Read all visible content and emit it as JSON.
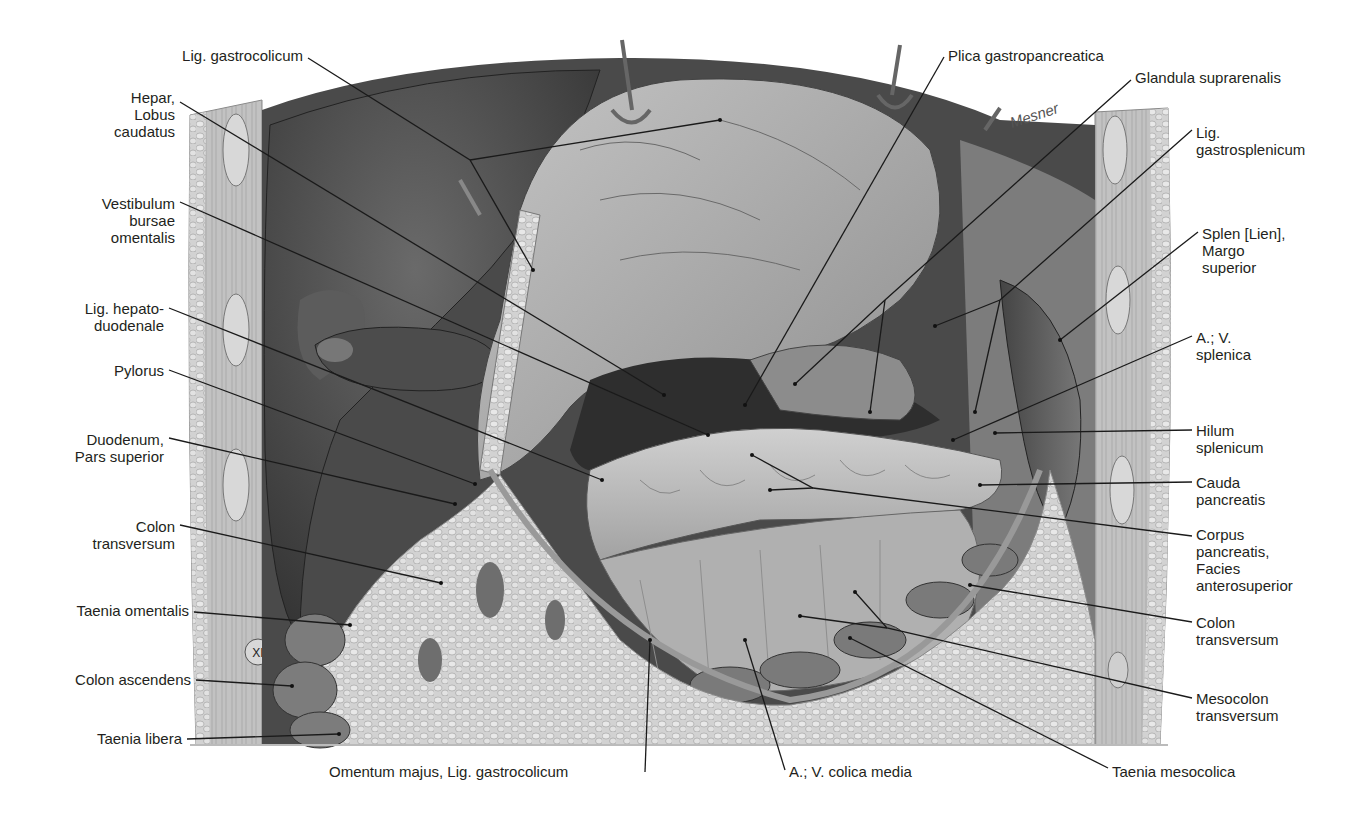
{
  "figure": {
    "type": "anatomical-illustration",
    "signature": "Mesner",
    "rib_marker": "XI"
  },
  "labels_left": [
    {
      "id": "lig-gastrocolicum-top",
      "text": "Lig. gastrocolicum",
      "x": 303,
      "y": 54,
      "ax": 533,
      "ay": 270
    },
    {
      "id": "hepar-lobus-caudatus",
      "text": "Hepar,\nLobus\ncaudatus",
      "x": 176,
      "y": 96,
      "ax": 664,
      "ay": 395
    },
    {
      "id": "vestibulum-bursae-omentalis",
      "text": "Vestibulum\nbursae\nomentalis",
      "x": 176,
      "y": 196,
      "ax": 708,
      "ay": 435
    },
    {
      "id": "lig-hepatoduodenale",
      "text": "Lig. hepato-\nduodenale",
      "x": 165,
      "y": 302,
      "ax": 602,
      "ay": 480
    },
    {
      "id": "pylorus",
      "text": "Pylorus",
      "x": 165,
      "y": 365,
      "ax": 475,
      "ay": 484
    },
    {
      "id": "duodenum-pars-superior",
      "text": "Duodenum,\nPars superior",
      "x": 165,
      "y": 432,
      "ax": 455,
      "ay": 504
    },
    {
      "id": "colon-transversum-left",
      "text": "Colon\ntransversum",
      "x": 176,
      "y": 519,
      "ax": 441,
      "ay": 583
    },
    {
      "id": "taenia-omentalis",
      "text": "Taenia omentalis",
      "x": 190,
      "y": 609,
      "ax": 350,
      "ay": 625
    },
    {
      "id": "colon-ascendens",
      "text": "Colon ascendens",
      "x": 192,
      "y": 678,
      "ax": 292,
      "ay": 686
    },
    {
      "id": "taenia-libera",
      "text": "Taenia libera",
      "x": 183,
      "y": 737,
      "ax": 339,
      "ay": 734
    }
  ],
  "labels_right": [
    {
      "id": "plica-gastropancreatica",
      "text": "Plica gastropancreatica",
      "x": 948,
      "y": 54,
      "ax": 745,
      "ay": 405
    },
    {
      "id": "glandula-suprarenalis",
      "text": "Glandula suprarenalis",
      "x": 1135,
      "y": 76,
      "ax": 795,
      "ay": 384
    },
    {
      "id": "lig-gastrosplenicum",
      "text": "Lig.\ngastrosplenicum",
      "x": 1196,
      "y": 125,
      "ax": 935,
      "ay": 326
    },
    {
      "id": "splen-margo-superior",
      "text": "Splen [Lien],\nMargo\nsuperior",
      "x": 1202,
      "y": 226,
      "ax": 1060,
      "ay": 340
    },
    {
      "id": "a-v-splenica",
      "text": "A.; V.\nsplenica",
      "x": 1196,
      "y": 330,
      "ax": 953,
      "ay": 440
    },
    {
      "id": "hilum-splenicum",
      "text": "Hilum\nsplenicum",
      "x": 1196,
      "y": 422,
      "ax": 995,
      "ay": 433
    },
    {
      "id": "cauda-pancreatis",
      "text": "Cauda\npancreatis",
      "x": 1196,
      "y": 474,
      "ax": 980,
      "ay": 485
    },
    {
      "id": "corpus-pancreatis",
      "text": "Corpus\npancreatis,\nFacies\nanterosuperior",
      "x": 1196,
      "y": 526,
      "ax": 770,
      "ay": 490
    },
    {
      "id": "colon-transversum-right",
      "text": "Colon\ntransversum",
      "x": 1196,
      "y": 614,
      "ax": 970,
      "ay": 585
    },
    {
      "id": "mesocolon-transversum",
      "text": "Mesocolon\ntransversum",
      "x": 1196,
      "y": 690,
      "ax": 800,
      "ay": 616
    },
    {
      "id": "taenia-mesocolica",
      "text": "Taenia mesocolica",
      "x": 1112,
      "y": 765,
      "ax": 850,
      "ay": 638
    }
  ],
  "labels_bottom": [
    {
      "id": "omentum-majus",
      "text": "Omentum majus, Lig. gastrocolicum",
      "x": 329,
      "y": 765,
      "ax": 650,
      "ay": 640
    },
    {
      "id": "a-v-colica-media",
      "text": "A.; V. colica media",
      "x": 789,
      "y": 765,
      "ax": 745,
      "ay": 640
    }
  ],
  "colors": {
    "text": "#231f20",
    "leader": "#1a1a1a",
    "liver_dark": "#3e3e3e",
    "liver_mid": "#5a5a5a",
    "wall": "#b8b8b8",
    "wall_light": "#d6d6d6",
    "stomach": "#a8a8a8",
    "stomach_light": "#c9c9c9",
    "pancreas": "#bdbdbd",
    "omentum": "#d0d0d0",
    "cavity": "#2c2c2c",
    "spleen": "#555555"
  }
}
